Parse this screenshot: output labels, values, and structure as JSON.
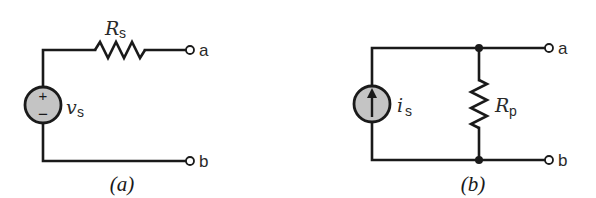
{
  "figure": {
    "panels": [
      {
        "id": "a",
        "caption": "(a)",
        "source": {
          "type": "voltage-source",
          "symbol": "v",
          "subscript": "s",
          "polarity_plus": "+",
          "polarity_minus": "−"
        },
        "resistor": {
          "connection": "series",
          "symbol": "R",
          "subscript": "s"
        },
        "terminals": [
          "a",
          "b"
        ]
      },
      {
        "id": "b",
        "caption": "(b)",
        "source": {
          "type": "current-source",
          "symbol": "i",
          "subscript": "s",
          "arrow_direction": "up"
        },
        "resistor": {
          "connection": "parallel",
          "symbol": "R",
          "subscript": "p"
        },
        "terminals": [
          "a",
          "b"
        ]
      }
    ],
    "colors": {
      "line": "#1a1a1a",
      "source_fill": "#c4c4c4",
      "background": "#ffffff"
    }
  }
}
